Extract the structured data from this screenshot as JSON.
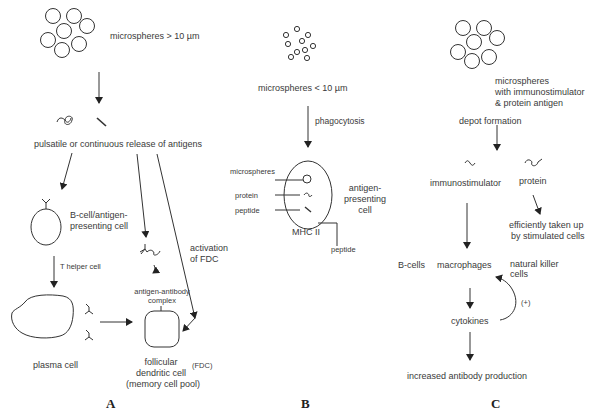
{
  "panels": {
    "A": {
      "letter": "A",
      "microspheres_label": "microspheres > 10 µm",
      "release_label": "pulsatile or continuous release of antigens",
      "bcell_label_1": "B-cell/antigen-",
      "bcell_label_2": "presenting cell",
      "thelper_label": "T helper cell",
      "plasma_label": "plasma cell",
      "complex_label_1": "antigen-antibody",
      "complex_label_2": "complex",
      "activation_label_1": "activation",
      "activation_label_2": "of FDC",
      "fdc_label_1": "follicular",
      "fdc_label_2": "dendritic cell",
      "fdc_abbrev": "(FDC)",
      "fdc_label_3": "(memory cell pool)"
    },
    "B": {
      "letter": "B",
      "microspheres_label": "microspheres < 10 µm",
      "phagocytosis_label": "phagocytosis",
      "inner_microspheres": "microspheres",
      "inner_protein": "protein",
      "inner_peptide": "peptide",
      "apc_label_1": "antigen-",
      "apc_label_2": "presenting",
      "apc_label_3": "cell",
      "mhc_label": "MHC II",
      "peptide_out_label": "peptide"
    },
    "C": {
      "letter": "C",
      "microspheres_label_1": "microspheres",
      "microspheres_label_2": "with immunostimulator",
      "microspheres_label_3": "& protein antigen",
      "depot_label": "depot formation",
      "immunostimulator_label": "immunostimulator",
      "protein_label": "protein",
      "uptake_label_1": "efficiently taken up",
      "uptake_label_2": "by stimulated cells",
      "bcells_label": "B-cells",
      "macrophages_label": "macrophages",
      "nk_label_1": "natural killer",
      "nk_label_2": "cells",
      "feedback_label": "(+)",
      "cytokines_label": "cytokines",
      "production_label": "increased antibody production"
    }
  }
}
